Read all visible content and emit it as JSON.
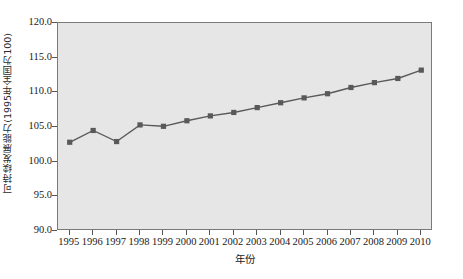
{
  "chart_data": {
    "type": "line",
    "title": "",
    "xlabel": "年份",
    "ylabel": "可持续发展能力(1995年全国为100)",
    "categories": [
      "1995",
      "1996",
      "1997",
      "1998",
      "1999",
      "2000",
      "2001",
      "2002",
      "2003",
      "2004",
      "2005",
      "2006",
      "2007",
      "2008",
      "2009",
      "2010"
    ],
    "x": [
      1995,
      1996,
      1997,
      1998,
      1999,
      2000,
      2001,
      2002,
      2003,
      2004,
      2005,
      2006,
      2007,
      2008,
      2009,
      2010
    ],
    "values": [
      102.8,
      104.5,
      102.9,
      105.3,
      105.1,
      105.9,
      106.6,
      107.1,
      107.8,
      108.5,
      109.2,
      109.8,
      110.7,
      111.4,
      112.0,
      113.2
    ],
    "ylim": [
      90.0,
      120.0
    ],
    "ytick_labels": [
      "120.0",
      "115.0",
      "110.0",
      "105.0",
      "100.0",
      "95.0",
      "90.0"
    ],
    "ytick_values": [
      120.0,
      115.0,
      110.0,
      105.0,
      100.0,
      95.0,
      90.0
    ],
    "grid": false,
    "legend": "none",
    "marker": "square",
    "series_color": "#595959",
    "plot_background": "#e6e6e6",
    "frame_color": "#7a7a7a",
    "figure_background": "#ffffff"
  },
  "axes": {
    "y_title": "可持续发展能力(1995年全国为100)",
    "x_title": "年份"
  },
  "caption": ""
}
